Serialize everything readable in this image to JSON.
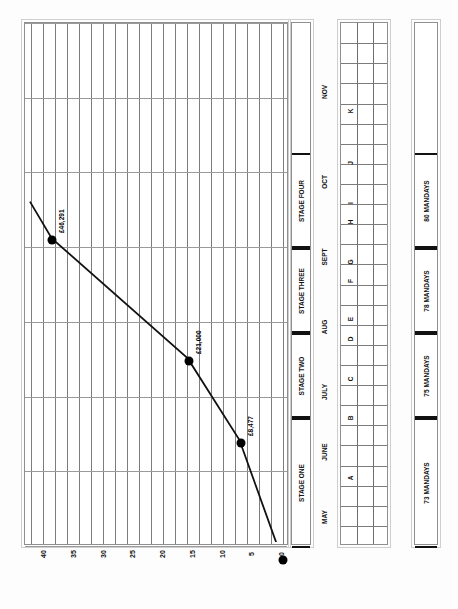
{
  "chart_data": {
    "type": "line",
    "title": "",
    "orientation": "rotated-90-ccw",
    "xlabel": "",
    "ylabel": "",
    "ylim": [
      0,
      42
    ],
    "yticks": [
      "0",
      "5",
      "10",
      "15",
      "20",
      "25",
      "30",
      "35",
      "40"
    ],
    "ytick_values": [
      0,
      5,
      10,
      15,
      20,
      25,
      30,
      35,
      40
    ],
    "grid": true,
    "x": [
      "MAY",
      "JUNE",
      "JULY",
      "AUG",
      "SEPT",
      "OCT",
      "NOV"
    ],
    "categories": [
      "MAY",
      "JUNE",
      "JULY",
      "AUG",
      "SEPT",
      "OCT",
      "NOV"
    ],
    "series": [
      {
        "name": "Cumulative cost",
        "points": [
          {
            "label": "",
            "value": 0,
            "month": "MAY",
            "x_frac": 0.045,
            "y_frac": 0.0
          },
          {
            "label": "£8,477",
            "value": 8.477,
            "month": "JUNE",
            "x_frac": 0.305,
            "y_frac": 0.205
          },
          {
            "label": "£21,000",
            "value": 21.0,
            "month": "JULY",
            "x_frac": 0.545,
            "y_frac": 0.5
          },
          {
            "label": "£46,291",
            "value": 46.291,
            "month": "SEPT",
            "x_frac": 0.79,
            "y_frac": 0.96
          }
        ]
      }
    ],
    "data_labels": [
      "£8,477",
      "£21,000",
      "£46,291"
    ],
    "legend": [],
    "legend_position": "none",
    "annotations": []
  },
  "axis": {
    "value_ticks": [
      "40",
      "35",
      "30",
      "25",
      "20",
      "15",
      "10",
      "5",
      "0"
    ],
    "month_labels": [
      "NOV",
      "OCT",
      "SEPT",
      "AUG",
      "JULY",
      "JUNE",
      "MAY"
    ]
  },
  "stages": {
    "title": "",
    "items": [
      {
        "label": "STAGE FOUR"
      },
      {
        "label": "STAGE THREE"
      },
      {
        "label": "STAGE TWO"
      },
      {
        "label": "STAGE ONE"
      }
    ]
  },
  "activities": {
    "letters": [
      "K",
      "J",
      "I",
      "H",
      "G",
      "F",
      "E",
      "D",
      "C",
      "B",
      "A"
    ],
    "columns": 3
  },
  "mandays": {
    "items": [
      {
        "label": "80 MANDAYS",
        "value": 80
      },
      {
        "label": "78 MANDAYS",
        "value": 78
      },
      {
        "label": "75 MANDAYS",
        "value": 75
      },
      {
        "label": "73 MANDAYS",
        "value": 73
      }
    ]
  },
  "colors": {
    "line": "#111111",
    "marker": "#000000",
    "grid_major": "#7d7d7d",
    "grid_minor": "#a9a9a9",
    "frame": "#8f8f8f",
    "page": "#fdfdfd"
  }
}
